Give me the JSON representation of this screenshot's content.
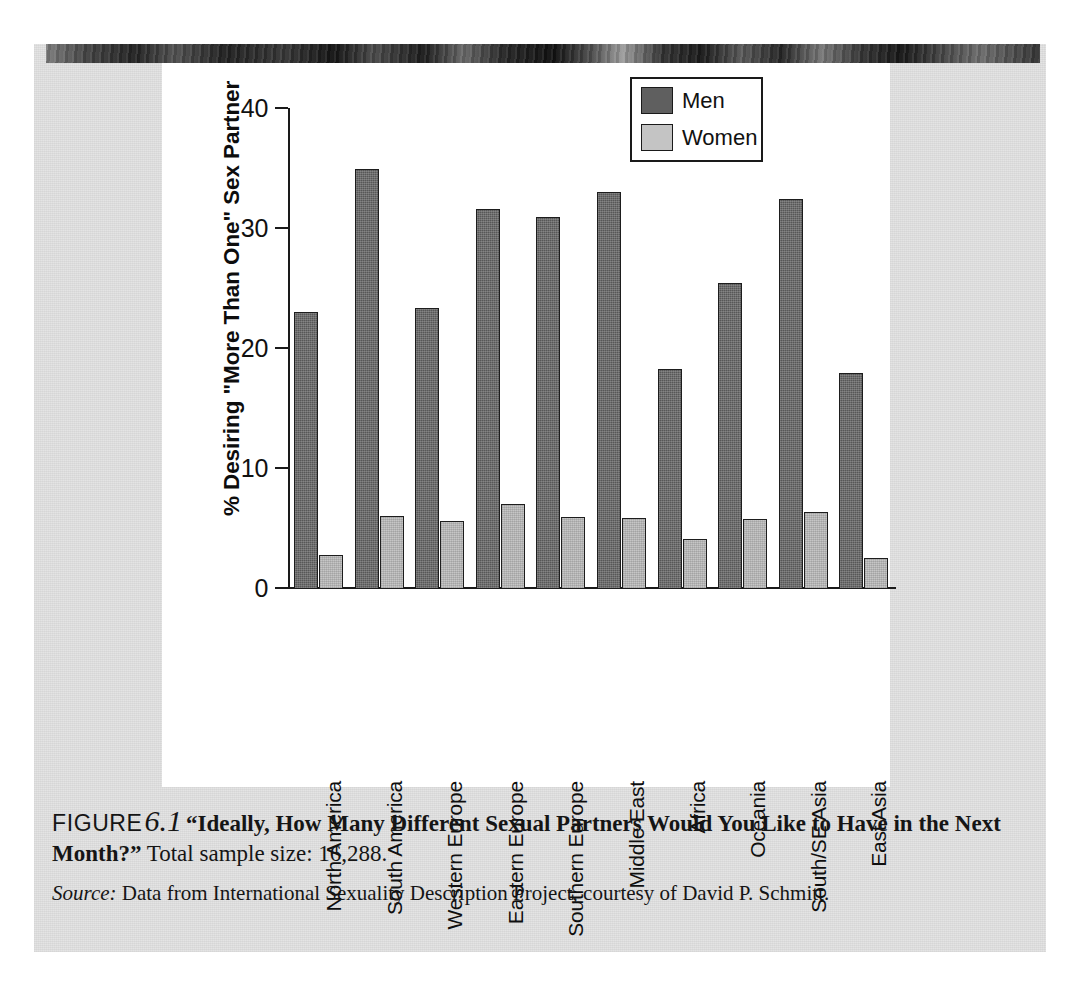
{
  "figure": {
    "figure_word": "FIGURE",
    "figure_number": "6.1",
    "caption_bold": "“Ideally, How Many Different Sexual Partners Would You Like to Have in the Next Month?”",
    "caption_rest": " Total sample size: 16,288.",
    "source_word": "Source:",
    "source_rest": " Data from International Sexuality Description Project, courtesy of David P. Schmitt."
  },
  "legend": {
    "items": [
      {
        "label": "Men",
        "color": "#575757"
      },
      {
        "label": "Women",
        "color": "#c6c6c6"
      }
    ]
  },
  "chart_data": {
    "type": "bar",
    "title": "",
    "xlabel": "",
    "ylabel": "% Desiring \"More Than One\" Sex Partner",
    "ylim": [
      0,
      40
    ],
    "yticks": [
      0,
      10,
      20,
      30,
      40
    ],
    "ytick_labels": [
      "0",
      "10",
      "20",
      "30",
      "40"
    ],
    "grid": false,
    "legend_position": "top-right",
    "categories": [
      "North America",
      "South America",
      "Western Europe",
      "Eastern Europe",
      "Southern Europe",
      "Middle East",
      "Africa",
      "Oceania",
      "South/SE Asia",
      "East Asia"
    ],
    "series": [
      {
        "name": "Men",
        "color": "#575757",
        "values": [
          23.1,
          35.0,
          23.4,
          31.7,
          31.0,
          33.1,
          18.3,
          25.5,
          32.5,
          18.0
        ]
      },
      {
        "name": "Women",
        "color": "#c6c6c6",
        "values": [
          2.8,
          6.1,
          5.7,
          7.1,
          6.0,
          5.9,
          4.2,
          5.8,
          6.4,
          2.6
        ]
      }
    ]
  }
}
